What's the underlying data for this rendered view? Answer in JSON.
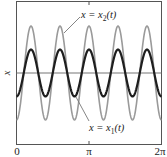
{
  "chart_data": {
    "type": "line",
    "title": "",
    "xlabel": "",
    "ylabel": "x",
    "xlim": [
      0,
      6.283185307
    ],
    "ylim": [
      -1.1,
      1.1
    ],
    "grid": false,
    "x_ticks": [
      {
        "value": 0,
        "label": "0"
      },
      {
        "value": 3.14159265,
        "label": "π"
      },
      {
        "value": 6.28318531,
        "label": "2π"
      }
    ],
    "series": [
      {
        "name": "x = x₂(t)",
        "label": "x = x₂(t)",
        "formula": "-1.0*cos(5t)",
        "amplitude": 1.0,
        "frequency": 5,
        "color": "#9a9a9a",
        "line_width": 1.6
      },
      {
        "name": "x = x₁(t)",
        "label": "x = x₁(t)",
        "formula": "-0.5*cos(5t)",
        "amplitude": 0.5,
        "frequency": 5,
        "color": "#1e1e1e",
        "line_width": 2.2
      }
    ],
    "annotations": [
      {
        "text": "x = x₂(t)",
        "target_series": "x = x₂(t)",
        "position": "top-center"
      },
      {
        "text": "x = x₁(t)",
        "target_series": "x = x₁(t)",
        "position": "bottom-center"
      }
    ],
    "zero_line": true
  },
  "labels": {
    "y_axis": "x",
    "x2_prefix": "x = x",
    "x2_sub": "2",
    "x2_suffix": "(t)",
    "x1_prefix": "x = x",
    "x1_sub": "1",
    "x1_suffix": "(t)",
    "tick0": "0",
    "tick_pi": "π",
    "tick_2pi": "2π"
  },
  "colors": {
    "frame": "#555555",
    "zero_line": "#777777",
    "leader": "#777777"
  }
}
